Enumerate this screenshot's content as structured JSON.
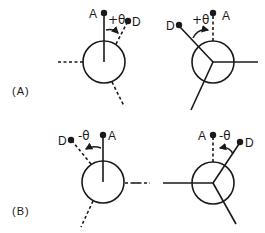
{
  "diagram": {
    "type": "newman-projections-dihedral-angle",
    "panels": [
      {
        "label": "(A)",
        "sign": "+θ",
        "projections": [
          {
            "position": "left",
            "center": [
              104,
              62
            ],
            "front_bond": "A (solid, up)",
            "back_bonds": [
              "D (dashed, upper-right)",
              "dashed left",
              "dashed lower-right"
            ],
            "atoms": {
              "A": "A",
              "D": "D"
            },
            "angle_label": "+θ"
          },
          {
            "position": "right",
            "center": [
              213,
              62
            ],
            "front_bond": "A (dashed, up)",
            "back_bonds": [
              "D (solid, upper-left)",
              "solid right",
              "solid lower-left"
            ],
            "atoms": {
              "A": "A",
              "D": "D"
            },
            "angle_label": "+θ"
          }
        ]
      },
      {
        "label": "(B)",
        "sign": "-θ",
        "projections": [
          {
            "position": "left",
            "center": [
              103,
              182
            ],
            "front_bond": "A (solid, up)",
            "back_bonds": [
              "D (dashed, upper-left)",
              "dashed right",
              "dashed lower-left"
            ],
            "atoms": {
              "A": "A",
              "D": "D"
            },
            "angle_label": "-θ"
          },
          {
            "position": "right",
            "center": [
              213,
              183
            ],
            "front_bond": "A (dashed, up)",
            "back_bonds": [
              "D (solid, upper-right)",
              "solid left",
              "solid lower-right"
            ],
            "atoms": {
              "A": "A",
              "D": "D"
            },
            "angle_label": "-θ"
          }
        ]
      }
    ]
  },
  "labels": {
    "panel_a": "(A)",
    "panel_b": "(B)",
    "atom_a": "A",
    "atom_d": "D",
    "theta_pos": "+θ",
    "theta_neg": "-θ"
  }
}
